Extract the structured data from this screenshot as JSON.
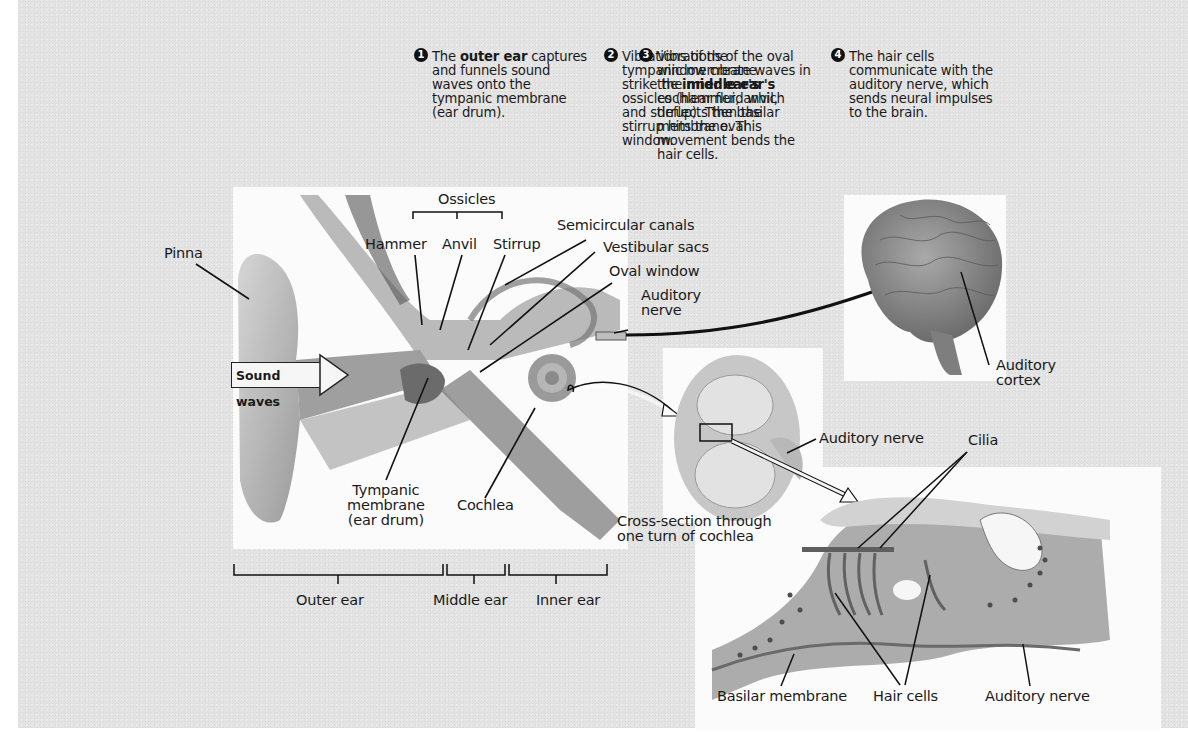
{
  "steps": [
    {
      "number": "1",
      "pre": "The ",
      "bold": "outer ear",
      "post": " captures and funnels sound waves onto the tympanic membrane (ear drum)."
    },
    {
      "number": "2",
      "pre": "Vibrations of the tympanic membrane strike the ",
      "bold": "middle ear's",
      "post": " ossicles (hammer, anvil, and stirrup). Then the stirrup hits the oval window."
    },
    {
      "number": "3",
      "pre": "Vibrations of the oval window create waves in the ",
      "bold": "inner ear's",
      "post": " cochlear fluid which deflects the basilar membrane. This movement bends the hair cells."
    },
    {
      "number": "4",
      "pre": "The hair cells communicate with the auditory nerve, which sends neural impulses to the brain.",
      "bold": "",
      "post": ""
    }
  ],
  "ear_labels": {
    "ossicles": "Ossicles",
    "hammer": "Hammer",
    "anvil": "Anvil",
    "stirrup": "Stirrup",
    "semicircular_canals": "Semicircular canals",
    "vestibular_sacs": "Vestibular sacs",
    "oval_window": "Oval window",
    "auditory_nerve_line1": "Auditory",
    "auditory_nerve_line2": "nerve",
    "pinna": "Pinna",
    "sound_waves": "Sound waves",
    "tympanic_line1": "Tympanic",
    "tympanic_line2": "membrane",
    "tympanic_line3": "(ear drum)",
    "cochlea": "Cochlea"
  },
  "regions": {
    "outer_ear": "Outer ear",
    "middle_ear": "Middle ear",
    "inner_ear": "Inner ear"
  },
  "brain_labels": {
    "auditory_cortex_line1": "Auditory",
    "auditory_cortex_line2": "cortex"
  },
  "cross_section": {
    "auditory_nerve": "Auditory nerve",
    "caption_line1": "Cross-section through",
    "caption_line2": "one turn of cochlea"
  },
  "hair_cell_detail": {
    "cilia": "Cilia",
    "basilar_membrane": "Basilar membrane",
    "hair_cells": "Hair cells",
    "auditory_nerve": "Auditory nerve"
  }
}
